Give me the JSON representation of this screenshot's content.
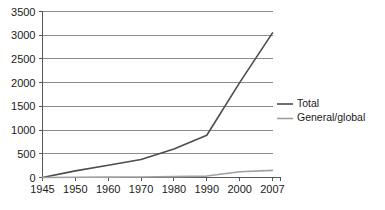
{
  "chart_data": {
    "type": "line",
    "title": "",
    "subtitle": "",
    "xlabel": "",
    "ylabel": "",
    "x": [
      "1945",
      "1950",
      "1960",
      "1970",
      "1980",
      "1990",
      "2000",
      "2007"
    ],
    "categories": [
      "1945",
      "1950",
      "1960",
      "1970",
      "1980",
      "1990",
      "2000",
      "2007"
    ],
    "series": [
      {
        "name": "Total",
        "color": "#4d4d4d",
        "values": [
          0,
          140,
          260,
          380,
          600,
          890,
          2000,
          3050
        ]
      },
      {
        "name": "General/global",
        "color": "#a0a0a0",
        "values": [
          0,
          5,
          8,
          12,
          18,
          30,
          120,
          150
        ]
      }
    ],
    "ylim": [
      0,
      3500
    ],
    "ytick_values": [
      0,
      500,
      1000,
      1500,
      2000,
      2500,
      3000,
      3500
    ],
    "ytick_labels": [
      "0",
      "500",
      "1000",
      "1500",
      "2000",
      "2500",
      "3000",
      "3500"
    ],
    "xtick_labels": [
      "1945",
      "1950",
      "1960",
      "1970",
      "1980",
      "1990",
      "2000",
      "2007"
    ],
    "grid": true,
    "grid_axis": "y",
    "legend": true,
    "legend_position": "right",
    "legend_entries": [
      {
        "label": "Total",
        "color": "#4d4d4d"
      },
      {
        "label": "General/global",
        "color": "#a0a0a0"
      }
    ]
  },
  "colors": {
    "background": "#ffffff",
    "grid": "#8c8c8c",
    "axis": "#555555",
    "text": "#1a1a1a",
    "total": "#4d4d4d",
    "general_global": "#a0a0a0"
  },
  "axis": {
    "y_labels": [
      "3500",
      "3000",
      "2500",
      "2000",
      "1500",
      "1000",
      "500",
      "0"
    ],
    "x_labels": [
      "1945",
      "1950",
      "1960",
      "1970",
      "1980",
      "1990",
      "2000",
      "2007"
    ]
  },
  "legend": {
    "items": [
      {
        "label": "Total"
      },
      {
        "label": "General/global"
      }
    ]
  }
}
